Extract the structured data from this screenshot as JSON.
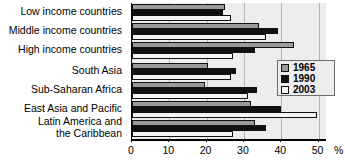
{
  "chart_data": {
    "type": "bar",
    "orientation": "horizontal",
    "title": "",
    "xlabel": "%",
    "ylabel": "",
    "xlim": [
      0,
      52
    ],
    "xticks": [
      0,
      10,
      20,
      30,
      40,
      50
    ],
    "xtick_labels": [
      "0",
      "10",
      "20",
      "30",
      "40",
      "50"
    ],
    "axis_unit": "%",
    "grid": true,
    "grid_axis": "x",
    "legend_position": "right",
    "categories": [
      "Low income countries",
      "Middle income countries",
      "High income countries",
      "South Asia",
      "Sub-Saharan Africa",
      "East Asia and Pacific",
      "Latin America and\nthe Caribbean"
    ],
    "series": [
      {
        "name": "1965",
        "color": "#9a9a9a",
        "values": [
          25.0,
          34.0,
          43.5,
          20.5,
          19.5,
          32.0,
          33.0
        ]
      },
      {
        "name": "1990",
        "color": "#111111",
        "values": [
          24.5,
          39.0,
          33.0,
          28.0,
          33.5,
          40.0,
          36.0
        ]
      },
      {
        "name": "2003",
        "color": "#f4f4f4",
        "values": [
          26.5,
          36.0,
          27.0,
          26.5,
          31.0,
          49.5,
          27.0
        ]
      }
    ]
  },
  "legend": {
    "entries": [
      {
        "label": "1965",
        "swatch": "gray"
      },
      {
        "label": "1990",
        "swatch": "black"
      },
      {
        "label": "2003",
        "swatch": "white"
      }
    ]
  },
  "axis": {
    "unit_label": "%",
    "tick_labels": [
      "0",
      "10",
      "20",
      "30",
      "40",
      "50"
    ]
  },
  "title_sliver": ""
}
